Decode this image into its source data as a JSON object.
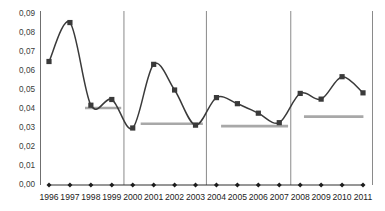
{
  "chart_data": {
    "type": "line",
    "title": "",
    "subtitle": "",
    "xlabel": "",
    "ylabel": "",
    "ylim": [
      0.0,
      0.09
    ],
    "grid": false,
    "legend": "none",
    "decimal_separator": ",",
    "categories": [
      "1996",
      "1997",
      "1998",
      "1999",
      "2000",
      "2001",
      "2002",
      "2003",
      "2004",
      "2005",
      "2006",
      "2007",
      "2008",
      "2009",
      "2010",
      "2011"
    ],
    "ytick_labels": [
      "0,09",
      "0,08",
      "0,07",
      "0,06",
      "0,05",
      "0,04",
      "0,03",
      "0,02",
      "0,01",
      "0,00"
    ],
    "ytick_values": [
      0.09,
      0.08,
      0.07,
      0.06,
      0.05,
      0.04,
      0.03,
      0.02,
      0.01,
      0.0
    ],
    "series": [
      {
        "name": "main-series",
        "marker": "square",
        "color": "#3a3a3a",
        "values": [
          0.065,
          0.0855,
          0.042,
          0.045,
          0.03,
          0.0635,
          0.05,
          0.0315,
          0.046,
          0.0428,
          0.0378,
          0.0328,
          0.0482,
          0.0452,
          0.057,
          0.0485
        ]
      },
      {
        "name": "baseline-series",
        "marker": "diamond",
        "color": "#1d1d1d",
        "values": [
          0.0,
          0.0,
          0.0,
          0.0,
          0.0,
          0.0,
          0.0,
          0.0,
          0.0,
          0.0,
          0.0,
          0.0,
          0.0,
          0.0,
          0.0,
          0.0
        ]
      }
    ],
    "period_averages": [
      {
        "name": "avg-1996-1999",
        "value": 0.0405,
        "start_category": "1998",
        "end_category": "1999",
        "start_index": 1.72,
        "end_index": 3.45,
        "color": "#a8a8a8"
      },
      {
        "name": "avg-2000-2003",
        "value": 0.0322,
        "start_category": "2000",
        "end_category": "2003",
        "start_index": 4.38,
        "end_index": 7.35,
        "color": "#a8a8a8"
      },
      {
        "name": "avg-2004-2007",
        "value": 0.031,
        "start_category": "2004",
        "end_category": "2007",
        "start_index": 8.22,
        "end_index": 11.42,
        "color": "#a8a8a8"
      },
      {
        "name": "avg-2008-2011",
        "value": 0.036,
        "start_category": "2008",
        "end_category": "2011",
        "start_index": 12.18,
        "end_index": 15.02,
        "color": "#a8a8a8"
      }
    ],
    "period_dividers": [
      {
        "name": "divider-after-1999",
        "after_category": "1999",
        "at_index": 3.58
      },
      {
        "name": "divider-after-2003",
        "after_category": "2003",
        "at_index": 7.52
      },
      {
        "name": "divider-after-2007",
        "after_category": "2007",
        "at_index": 11.55
      }
    ],
    "axis_border_right": true
  }
}
